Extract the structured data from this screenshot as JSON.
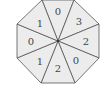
{
  "diagram": {
    "shape": "octagon-spinner",
    "center": [
      58,
      41
    ],
    "fill_color": "#ececec",
    "stroke_color": "#555555",
    "sectors": [
      {
        "label": "0",
        "pos": [
          58,
          11
        ]
      },
      {
        "label": "3",
        "pos": [
          79,
          20
        ]
      },
      {
        "label": "2",
        "pos": [
          87,
          40
        ]
      },
      {
        "label": "0",
        "pos": [
          79,
          60
        ]
      },
      {
        "label": "2",
        "pos": [
          58,
          69
        ]
      },
      {
        "label": "1",
        "pos": [
          37,
          60
        ]
      },
      {
        "label": "0",
        "pos": [
          29,
          40
        ]
      },
      {
        "label": "1",
        "pos": [
          38,
          21
        ]
      }
    ]
  }
}
